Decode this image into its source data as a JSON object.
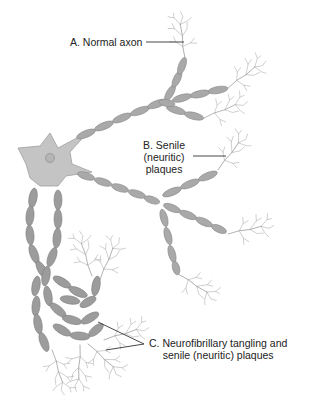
{
  "diagram": {
    "labels": {
      "a": {
        "lines": [
          "A. Normal axon"
        ]
      },
      "b": {
        "lines": [
          "B. Senile",
          "(neuritic)",
          "plaques"
        ]
      },
      "c": {
        "lines": [
          "C. Neurofibrillary tangling and",
          "senile (neuritic) plaques"
        ]
      }
    },
    "colors": {
      "background": "#ffffff",
      "cell_body": "#c4c4c4",
      "axon_segment": "#a9a9a9",
      "dendrite": "#9a9a9a",
      "leader_line": "#333333",
      "text": "#222222"
    }
  }
}
